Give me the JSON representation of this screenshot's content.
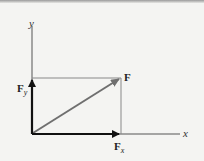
{
  "diagram": {
    "labels": {
      "y_axis": "y",
      "x_axis": "x",
      "force": "F",
      "fy_main": "F",
      "fy_sub": "y",
      "fx_main": "F",
      "fx_sub": "x"
    },
    "colors": {
      "background": "#f4f4f2",
      "axis": "#555555",
      "rectangle": "#888888",
      "force_vector": "#6f6f6f",
      "components": "#111111"
    }
  }
}
